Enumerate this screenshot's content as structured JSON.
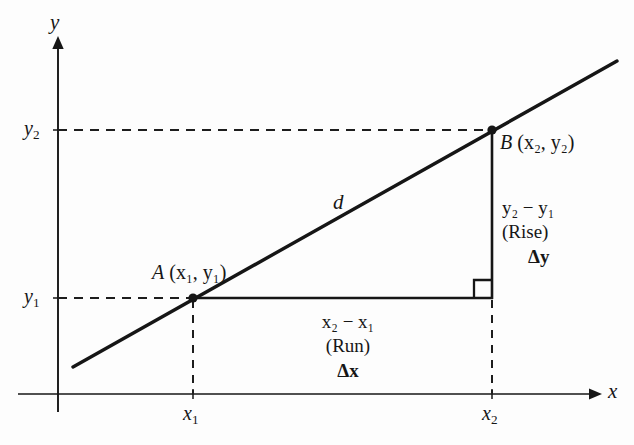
{
  "figure": {
    "title": "",
    "type": "coordinate-geometry-diagram",
    "background_color": "#fdfdfd",
    "stroke_color": "#161616",
    "axes": {
      "x_axis_label": "x",
      "y_axis_label": "y",
      "origin_px": [
        58,
        394
      ],
      "x_axis_span_px": [
        18,
        596
      ],
      "y_axis_span_px": [
        42,
        412
      ]
    },
    "tick_labels": {
      "y_upper": "y",
      "y_upper_sub": "2",
      "y_lower": "y",
      "y_lower_sub": "1",
      "x_left": "x",
      "x_left_sub": "1",
      "x_right": "x",
      "x_right_sub": "2"
    },
    "points": [
      {
        "name": "A",
        "label_main": "A",
        "label_coords": "(x₁, y₁)",
        "px": [
          193,
          298
        ]
      },
      {
        "name": "B",
        "label_main": "B",
        "label_coords": "(x₂, y₂)",
        "px": [
          492,
          130
        ]
      }
    ],
    "line": {
      "label": "d",
      "description": "secant line through A and B",
      "endpoints_px": [
        [
          73,
          367
        ],
        [
          617,
          61
        ]
      ]
    },
    "rise_group": {
      "expression_base": "y",
      "expression": "y₂ − y₁",
      "word": "(Rise)",
      "delta": "Δy"
    },
    "run_group": {
      "expression_base": "x",
      "expression": "x₂ − x₁",
      "word": "(Run)",
      "delta": "Δx"
    },
    "right_angle_marker": {
      "present": true,
      "corner_px": [
        492,
        298
      ],
      "size_px": 18
    },
    "guide_lines": [
      {
        "name": "y2-horizontal-dashed",
        "style": "dashed",
        "from_px": [
          58,
          130
        ],
        "to_px": [
          492,
          130
        ]
      },
      {
        "name": "y1-horizontal-dashed",
        "style": "dashed",
        "from_px": [
          58,
          298
        ],
        "to_px": [
          193,
          298
        ]
      },
      {
        "name": "triangle-base-solid",
        "style": "solid",
        "from_px": [
          193,
          298
        ],
        "to_px": [
          492,
          298
        ]
      },
      {
        "name": "triangle-vertical-solid",
        "style": "solid",
        "from_px": [
          492,
          130
        ],
        "to_px": [
          492,
          298
        ]
      },
      {
        "name": "x1-vertical-dashed",
        "style": "dashed",
        "from_px": [
          193,
          298
        ],
        "to_px": [
          193,
          394
        ]
      },
      {
        "name": "x2-vertical-dashed",
        "style": "dashed",
        "from_px": [
          492,
          298
        ],
        "to_px": [
          492,
          394
        ]
      }
    ]
  }
}
